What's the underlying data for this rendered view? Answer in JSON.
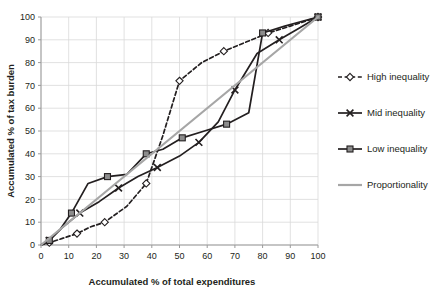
{
  "chart_data": {
    "type": "line",
    "title": "",
    "xlabel": "Accumulated % of total expenditures",
    "ylabel": "Accumulated % of tax burden",
    "xlim": [
      0,
      100
    ],
    "ylim": [
      0,
      100
    ],
    "xticks": [
      0,
      10,
      20,
      30,
      40,
      50,
      60,
      70,
      80,
      90,
      100
    ],
    "yticks": [
      0,
      10,
      20,
      30,
      40,
      50,
      60,
      70,
      80,
      90,
      100
    ],
    "grid": true,
    "legend_position": "right",
    "series": [
      {
        "name": "High inequality",
        "marker": "diamond",
        "linestyle": "dashed",
        "color": "#231f20",
        "x": [
          0,
          3,
          8,
          13,
          18,
          23,
          31,
          38,
          44,
          50,
          58,
          66,
          74,
          82,
          90,
          100
        ],
        "y": [
          0,
          1,
          3,
          5,
          8,
          10,
          17,
          27,
          48,
          72,
          80,
          85,
          89,
          93,
          96,
          100
        ]
      },
      {
        "name": "Mid inequality",
        "marker": "x",
        "linestyle": "solid",
        "color": "#231f20",
        "x": [
          0,
          3,
          8,
          14,
          21,
          28,
          35,
          42,
          50,
          57,
          64,
          70,
          78,
          86,
          93,
          100
        ],
        "y": [
          0,
          2,
          8,
          14,
          19,
          25,
          30,
          34,
          39,
          45,
          54,
          68,
          84,
          90,
          95,
          100
        ]
      },
      {
        "name": "Low inequality",
        "marker": "square",
        "linestyle": "solid",
        "color": "#231f20",
        "x": [
          0,
          3,
          7,
          11,
          17,
          24,
          31,
          38,
          44,
          51,
          59,
          67,
          75,
          80,
          88,
          100
        ],
        "y": [
          0,
          2,
          7,
          14,
          27,
          30,
          31,
          40,
          42,
          47,
          50,
          53,
          58,
          93,
          96,
          100
        ]
      },
      {
        "name": "Proportionality",
        "marker": "none",
        "linestyle": "solid",
        "color": "#a6a6a6",
        "x": [
          0,
          100
        ],
        "y": [
          0,
          100
        ]
      }
    ]
  },
  "legend": {
    "items": [
      {
        "label": "High inequality",
        "marker": "diamond",
        "linestyle": "dashed",
        "color": "#231f20"
      },
      {
        "label": "Mid inequality",
        "marker": "x",
        "linestyle": "solid",
        "color": "#231f20"
      },
      {
        "label": "Low inequality",
        "marker": "square",
        "linestyle": "solid",
        "color": "#231f20"
      },
      {
        "label": "Proportionality",
        "marker": "none",
        "linestyle": "solid",
        "color": "#a6a6a6"
      }
    ]
  },
  "axes": {
    "x_title": "Accumulated % of total expenditures",
    "y_title": "Accumulated % of tax burden"
  },
  "colors": {
    "data": "#231f20",
    "proportionality": "#a6a6a6",
    "grid": "#d9d9d9",
    "axis": "#9a9a9a",
    "background": "#ffffff"
  }
}
